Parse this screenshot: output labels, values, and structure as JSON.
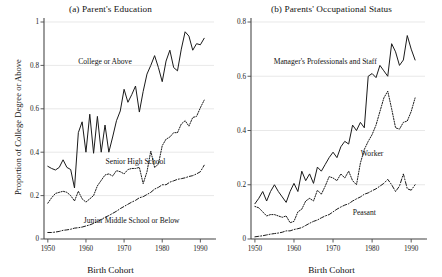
{
  "figure": {
    "panels": [
      {
        "id": "a",
        "title": "(a) Parent's Education",
        "xlabel": "Birth Cohort",
        "ylabel": "Proportion of College Degree or Above"
      },
      {
        "id": "b",
        "title": "(b) Parents' Occupational Status",
        "xlabel": "Birth Cohort",
        "ylabel": ""
      }
    ]
  },
  "chart_data": [
    {
      "type": "line",
      "title": "(a) Parent's Education",
      "xlabel": "Birth Cohort",
      "ylabel": "Proportion of College Degree or Above",
      "xlim": [
        1949,
        1992
      ],
      "ylim": [
        0,
        1
      ],
      "xticks": [
        1950,
        1960,
        1970,
        1980,
        1990
      ],
      "xticklabels": [
        "1950",
        "1960",
        "1970",
        "1980",
        "1990"
      ],
      "yticks": [
        0,
        0.2,
        0.4,
        0.6,
        0.8,
        1
      ],
      "yticklabels": [
        "0",
        "0.2",
        "0.4",
        "0.6",
        "0.8",
        "1"
      ],
      "grid": true,
      "legend_position": "inline-annotations",
      "x": [
        1950,
        1951,
        1952,
        1953,
        1954,
        1955,
        1956,
        1957,
        1958,
        1959,
        1960,
        1961,
        1962,
        1963,
        1964,
        1965,
        1966,
        1967,
        1968,
        1969,
        1970,
        1971,
        1972,
        1973,
        1974,
        1975,
        1976,
        1977,
        1978,
        1979,
        1980,
        1981,
        1982,
        1983,
        1984,
        1985,
        1986,
        1987,
        1988,
        1989,
        1990,
        1991
      ],
      "series": [
        {
          "name": "College or Above",
          "style": "solid",
          "values": [
            0.335,
            0.325,
            0.318,
            0.33,
            0.365,
            0.33,
            0.32,
            0.235,
            0.49,
            0.54,
            0.4,
            0.575,
            0.395,
            0.565,
            0.4,
            0.525,
            0.4,
            0.47,
            0.545,
            0.59,
            0.69,
            0.63,
            0.665,
            0.705,
            0.585,
            0.68,
            0.76,
            0.8,
            0.845,
            0.79,
            0.725,
            0.82,
            0.87,
            0.79,
            0.775,
            0.875,
            0.955,
            0.935,
            0.87,
            0.9,
            0.895,
            0.925
          ]
        },
        {
          "name": "Senior High School",
          "style": "dotted",
          "values": [
            0.165,
            0.19,
            0.21,
            0.215,
            0.22,
            0.215,
            0.2,
            0.175,
            0.22,
            0.185,
            0.17,
            0.185,
            0.2,
            0.245,
            0.27,
            0.295,
            0.3,
            0.29,
            0.315,
            0.31,
            0.3,
            0.32,
            0.325,
            0.325,
            0.33,
            0.255,
            0.31,
            0.405,
            0.33,
            0.345,
            0.43,
            0.46,
            0.47,
            0.49,
            0.49,
            0.53,
            0.545,
            0.52,
            0.56,
            0.565,
            0.605,
            0.64
          ]
        },
        {
          "name": "Junior Middle School or Below",
          "style": "dashdot",
          "values": [
            0.03,
            0.03,
            0.032,
            0.035,
            0.04,
            0.042,
            0.045,
            0.05,
            0.052,
            0.055,
            0.06,
            0.065,
            0.072,
            0.08,
            0.09,
            0.1,
            0.108,
            0.118,
            0.128,
            0.14,
            0.15,
            0.16,
            0.17,
            0.178,
            0.19,
            0.195,
            0.205,
            0.215,
            0.23,
            0.238,
            0.25,
            0.25,
            0.262,
            0.268,
            0.275,
            0.278,
            0.282,
            0.288,
            0.292,
            0.3,
            0.31,
            0.34
          ]
        }
      ],
      "annotations": [
        {
          "text": "College or Above",
          "x": 1965,
          "y": 0.805
        },
        {
          "text": "Senior High School",
          "x": 1973,
          "y": 0.345
        },
        {
          "text": "Junior Middle School or Below",
          "x": 1972,
          "y": 0.072
        }
      ]
    },
    {
      "type": "line",
      "title": "(b) Parents' Occupational Status",
      "xlabel": "Birth Cohort",
      "ylabel": "",
      "xlim": [
        1949,
        1992
      ],
      "ylim": [
        0,
        0.8
      ],
      "xticks": [
        1950,
        1960,
        1970,
        1980,
        1990
      ],
      "xticklabels": [
        "1950",
        "1960",
        "1970",
        "1980",
        "1990"
      ],
      "yticks": [
        0,
        0.2,
        0.4,
        0.6,
        0.8
      ],
      "yticklabels": [
        "0",
        "0.2",
        "0.4",
        "0.6",
        "0.8"
      ],
      "grid": true,
      "legend_position": "inline-annotations",
      "x": [
        1950,
        1951,
        1952,
        1953,
        1954,
        1955,
        1956,
        1957,
        1958,
        1959,
        1960,
        1961,
        1962,
        1963,
        1964,
        1965,
        1966,
        1967,
        1968,
        1969,
        1970,
        1971,
        1972,
        1973,
        1974,
        1975,
        1976,
        1977,
        1978,
        1979,
        1980,
        1981,
        1982,
        1983,
        1984,
        1985,
        1986,
        1987,
        1988,
        1989,
        1990,
        1991
      ],
      "series": [
        {
          "name": "Manager's Professionals and Staff",
          "style": "solid",
          "values": [
            0.13,
            0.15,
            0.175,
            0.14,
            0.175,
            0.2,
            0.175,
            0.155,
            0.135,
            0.175,
            0.205,
            0.175,
            0.25,
            0.215,
            0.24,
            0.205,
            0.265,
            0.25,
            0.275,
            0.3,
            0.32,
            0.3,
            0.34,
            0.36,
            0.35,
            0.42,
            0.4,
            0.43,
            0.41,
            0.6,
            0.61,
            0.595,
            0.64,
            0.62,
            0.6,
            0.72,
            0.69,
            0.64,
            0.66,
            0.75,
            0.7,
            0.66
          ]
        },
        {
          "name": "Worker",
          "style": "dotted",
          "values": [
            0.12,
            0.115,
            0.1,
            0.085,
            0.09,
            0.09,
            0.085,
            0.08,
            0.085,
            0.06,
            0.065,
            0.1,
            0.11,
            0.14,
            0.15,
            0.14,
            0.18,
            0.165,
            0.195,
            0.23,
            0.225,
            0.215,
            0.24,
            0.225,
            0.25,
            0.215,
            0.2,
            0.28,
            0.33,
            0.36,
            0.385,
            0.42,
            0.47,
            0.52,
            0.545,
            0.48,
            0.41,
            0.405,
            0.43,
            0.435,
            0.47,
            0.52
          ]
        },
        {
          "name": "Peasant",
          "style": "dashdot",
          "values": [
            0.008,
            0.01,
            0.012,
            0.015,
            0.018,
            0.02,
            0.022,
            0.025,
            0.03,
            0.03,
            0.035,
            0.038,
            0.042,
            0.05,
            0.058,
            0.065,
            0.07,
            0.078,
            0.085,
            0.09,
            0.1,
            0.11,
            0.118,
            0.125,
            0.13,
            0.14,
            0.148,
            0.155,
            0.165,
            0.17,
            0.178,
            0.185,
            0.195,
            0.205,
            0.22,
            0.2,
            0.175,
            0.195,
            0.24,
            0.185,
            0.18,
            0.2
          ]
        }
      ],
      "annotations": [
        {
          "text": "Manager's Professionals and Staff",
          "x": 1968,
          "y": 0.645
        },
        {
          "text": "Worker",
          "x": 1980,
          "y": 0.305
        },
        {
          "text": "Peasant",
          "x": 1978,
          "y": 0.09
        }
      ]
    }
  ]
}
